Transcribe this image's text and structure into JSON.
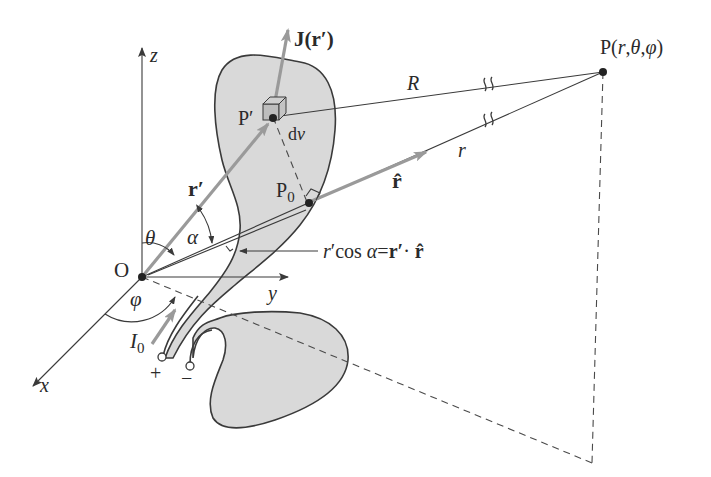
{
  "figure": {
    "type": "3D coordinate diagram: field at point P due to current distribution",
    "colors": {
      "line": "#3a3a3a",
      "blob_fill": "#d9d9d9",
      "vector_arrow": "#9a9a9a",
      "background": "#ffffff"
    }
  },
  "axes": {
    "z_label": "z",
    "y_label": "y",
    "x_label": "x",
    "origin_label": "O"
  },
  "points": {
    "field_point": "P(r,θ,φ)",
    "source_point": "P′",
    "foot_point_base": "P",
    "foot_point_sub": "0"
  },
  "vectors": {
    "current_density": "J(r′)",
    "source_position": "r′",
    "unit_vector": "r̂",
    "current": {
      "base": "I",
      "sub": "0"
    }
  },
  "distances": {
    "R": "R",
    "r": "r"
  },
  "angles": {
    "theta": "θ",
    "alpha": "α",
    "phi": "φ"
  },
  "volume_element": "dv",
  "projection_formula": {
    "lhs": "r′cos α",
    "eq": "=",
    "rhs": "r′· r̂"
  },
  "terminals": {
    "plus": "+",
    "minus": "−"
  }
}
